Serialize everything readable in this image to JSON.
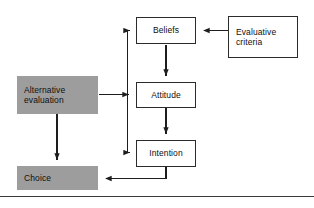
{
  "diagram": {
    "background_color": "#ffffff",
    "shaded_fill": "#9d9d9d",
    "line_color": "#1d1d1d",
    "nodes": [
      {
        "id": "beliefs",
        "label": "Beliefs",
        "style": "outlined",
        "align": "center"
      },
      {
        "id": "evaluative",
        "label": "Evaluative\ncriteria",
        "style": "outlined",
        "align": "left"
      },
      {
        "id": "attitude",
        "label": "Attitude",
        "style": "outlined",
        "align": "center"
      },
      {
        "id": "intention",
        "label": "Intention",
        "style": "outlined",
        "align": "center"
      },
      {
        "id": "alternative",
        "label": "Alternative\nevaluation",
        "style": "shaded",
        "align": "left"
      },
      {
        "id": "choice",
        "label": "Choice",
        "style": "shaded",
        "align": "left"
      }
    ],
    "edges": [
      {
        "from": "evaluative",
        "to": "beliefs",
        "direction": "left"
      },
      {
        "from": "beliefs",
        "to": "attitude",
        "direction": "down"
      },
      {
        "from": "attitude",
        "to": "intention",
        "direction": "down"
      },
      {
        "from": "alternative",
        "to": "beliefs",
        "direction": "right-up"
      },
      {
        "from": "alternative",
        "to": "intention",
        "direction": "right-down"
      },
      {
        "from": "alternative",
        "to": "choice",
        "direction": "down"
      },
      {
        "from": "intention",
        "to": "choice",
        "direction": "down-left"
      }
    ]
  }
}
